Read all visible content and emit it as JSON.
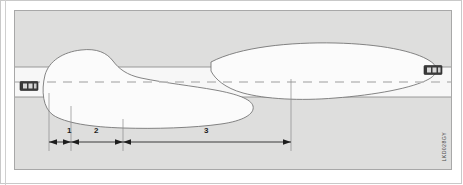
{
  "figure": {
    "id_code": "LKD028GY",
    "panel": {
      "background_color": "#dededd",
      "border_color": "#a8a8a8"
    },
    "road": {
      "surface_color": "#f7f7f7",
      "edge_color": "#8f8f8f",
      "center_line_color": "#bdbdbd",
      "center_line_style": "dashed",
      "top_edge_y": 56,
      "bottom_edge_y": 86
    },
    "zones": {
      "fill_color": "#fbfbfb",
      "outline_color": "#6f6f6f",
      "upper_label": "detection-zone-upper",
      "lower_label": "detection-zone-lower"
    },
    "vehicles": [
      {
        "name": "vehicle-left",
        "body_color": "#3a3a3a",
        "window_color": "#d8d8d8"
      },
      {
        "name": "vehicle-right",
        "body_color": "#3a3a3a",
        "window_color": "#d8d8d8"
      }
    ],
    "dimensions": {
      "line_color": "#3a3a3a",
      "tick_color": "#8a8a8a",
      "items": [
        {
          "label": "1",
          "x": 54
        },
        {
          "label": "2",
          "x": 94
        },
        {
          "label": "3",
          "x": 190
        }
      ]
    }
  }
}
